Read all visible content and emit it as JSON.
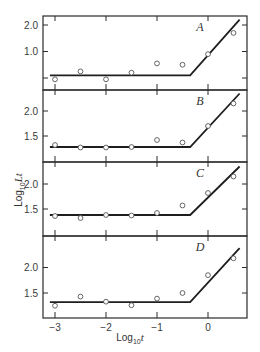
{
  "chart_data": {
    "type": "line",
    "layout": "four vertically stacked panels sharing x axis",
    "xlabel": "Log10 t",
    "ylabel": "Log10 Lt",
    "xlim": [
      -3.25,
      0.77
    ],
    "x_ticks": [
      -3,
      -2,
      -1,
      0
    ],
    "x_tick_labels": [
      "−3",
      "−2",
      "−1",
      "0"
    ],
    "grid": false,
    "legend": null,
    "panels": [
      {
        "label": "A",
        "ylim": [
          -0.45,
          2.3
        ],
        "y_ticks": [
          0.0,
          1.0,
          2.0
        ],
        "y_tick_labels": [
          "",
          "1.0",
          "2.0"
        ],
        "points": {
          "x": [
            -3,
            -2.5,
            -2,
            -1.5,
            -1,
            -0.5,
            0,
            0.5
          ],
          "y": [
            -0.05,
            0.25,
            -0.05,
            0.2,
            0.55,
            0.5,
            0.9,
            1.7
          ]
        },
        "fit_line": {
          "x": [
            -3.1,
            -0.35,
            0.62
          ],
          "y": [
            0.1,
            0.1,
            2.2
          ]
        }
      },
      {
        "label": "B",
        "ylim": [
          1.05,
          2.45
        ],
        "y_ticks": [
          1.5,
          2.0
        ],
        "y_tick_labels": [
          "1.5",
          "2.0"
        ],
        "points": {
          "x": [
            -3,
            -2.5,
            -2,
            -1.5,
            -1,
            -0.5,
            0,
            0.5
          ],
          "y": [
            1.32,
            1.27,
            1.27,
            1.28,
            1.42,
            1.37,
            1.7,
            2.15
          ]
        },
        "fit_line": {
          "x": [
            -3.1,
            -0.35,
            0.62
          ],
          "y": [
            1.28,
            1.28,
            2.35
          ]
        }
      },
      {
        "label": "C",
        "ylim": [
          1.05,
          2.45
        ],
        "y_ticks": [
          1.5,
          2.0
        ],
        "y_tick_labels": [
          "1.5",
          "2.0"
        ],
        "points": {
          "x": [
            -3,
            -2.5,
            -2,
            -1.5,
            -1,
            -0.5,
            0,
            0.5
          ],
          "y": [
            1.36,
            1.32,
            1.38,
            1.37,
            1.42,
            1.57,
            1.82,
            2.15
          ]
        },
        "fit_line": {
          "x": [
            -3.1,
            -0.35,
            0.62
          ],
          "y": [
            1.38,
            1.38,
            2.35
          ]
        }
      },
      {
        "label": "D",
        "ylim": [
          1.05,
          2.45
        ],
        "y_ticks": [
          1.5,
          2.0
        ],
        "y_tick_labels": [
          "1.5",
          "2.0"
        ],
        "points": {
          "x": [
            -3,
            -2.5,
            -2,
            -1.5,
            -1,
            -0.5,
            0,
            0.5
          ],
          "y": [
            1.25,
            1.43,
            1.33,
            1.26,
            1.39,
            1.5,
            1.85,
            2.18
          ]
        },
        "fit_line": {
          "x": [
            -3.1,
            -0.35,
            0.62
          ],
          "y": [
            1.32,
            1.32,
            2.38
          ]
        }
      }
    ]
  },
  "axis_titles": {
    "y_prefix": "Log",
    "y_sub": "10",
    "y_main": "Lt",
    "x_prefix": "Log",
    "x_sub": "10",
    "x_main": "t"
  },
  "colors": {
    "ink": "#1e1e1e",
    "frame": "#2a2a2a",
    "marker": "#555555",
    "background": "#ffffff"
  }
}
